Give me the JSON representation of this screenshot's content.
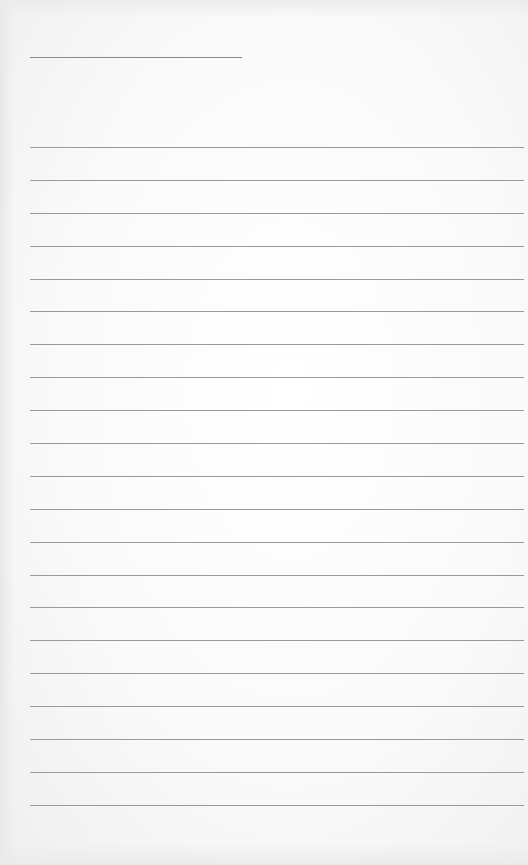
{
  "page": {
    "type": "lined-notepad-page",
    "background_color": "#fafafa",
    "line_color": "#9a9a9a",
    "title": "",
    "lines": [
      "",
      "",
      "",
      "",
      "",
      "",
      "",
      "",
      "",
      "",
      "",
      "",
      "",
      "",
      "",
      "",
      "",
      "",
      "",
      "",
      ""
    ]
  }
}
